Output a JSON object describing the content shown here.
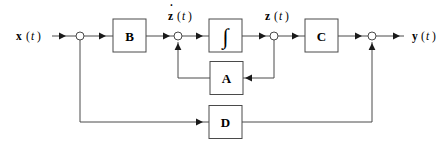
{
  "diagram": {
    "type": "signal-flow-block-diagram",
    "colors": {
      "background": "#ffffff",
      "wire": "#4a4a4a",
      "box_stroke": "#4a4a4a",
      "arrow_fill": "#1a1a1a",
      "text": "#000000"
    },
    "signals": {
      "input": {
        "var": "x",
        "open_paren": "(",
        "arg": "t",
        "close_paren": ")",
        "full": "x(t)"
      },
      "state_derivative": {
        "var": "z",
        "accent": "˙",
        "open_paren": "(",
        "arg": "t",
        "close_paren": ")",
        "full": "ż(t)"
      },
      "state": {
        "var": "z",
        "open_paren": "(",
        "arg": "t",
        "close_paren": ")",
        "full": "z(t)"
      },
      "output": {
        "var": "y",
        "open_paren": "(",
        "arg": "t",
        "close_paren": ")",
        "full": "y(t)"
      }
    },
    "blocks": [
      {
        "id": "B",
        "label": "B",
        "name": "input-matrix-block"
      },
      {
        "id": "INT",
        "label": "∫",
        "name": "integrator-block"
      },
      {
        "id": "C",
        "label": "C",
        "name": "output-matrix-block"
      },
      {
        "id": "A",
        "label": "A",
        "name": "state-matrix-block"
      },
      {
        "id": "D",
        "label": "D",
        "name": "feedthrough-matrix-block"
      }
    ],
    "nodes": [
      {
        "id": "n1",
        "name": "input-branch-node"
      },
      {
        "id": "n2",
        "name": "state-derivative-sum-node"
      },
      {
        "id": "n3",
        "name": "state-branch-node"
      },
      {
        "id": "n4",
        "name": "output-sum-node"
      }
    ]
  }
}
